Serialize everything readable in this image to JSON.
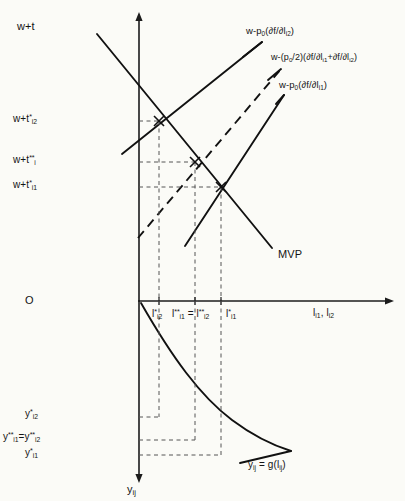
{
  "figure": {
    "type": "economics-diagram",
    "background_color": "#fbfbf7",
    "ink_color": "#111111",
    "upper_panel": {
      "y_axis_label": "w+t",
      "x_axis_label_parts": {
        "base": "l",
        "sub1": "i1",
        "sep": ", ",
        "base2": "l",
        "sub2": "i2"
      },
      "origin_label": "O",
      "y_tick_labels": [
        {
          "id": "w_t_star_i2",
          "base": "w+t",
          "sup": "*",
          "sub": "i2",
          "y_px": 121
        },
        {
          "id": "w_t_dstar_i",
          "base": "w+t",
          "sup": "**",
          "sub": "i",
          "y_px": 162
        },
        {
          "id": "w_t_star_i1",
          "base": "w+t",
          "sup": "*",
          "sub": "i1",
          "y_px": 187
        }
      ],
      "x_tick_labels": [
        {
          "id": "l_star_i2",
          "base": "l",
          "sup": "*",
          "sub": "i2",
          "x_px": 159
        },
        {
          "id": "l_dstar_equal",
          "base": "l",
          "sup": "**",
          "sub": "i1",
          "eq": " = ",
          "base2": "l",
          "sup2": "**",
          "sub2": "i2",
          "x_px": 195
        },
        {
          "id": "l_star_i1",
          "base": "l",
          "sup": "*",
          "sub": "i1",
          "x_px": 221
        }
      ],
      "curve_labels": [
        {
          "id": "mvp",
          "text": "MVP"
        },
        {
          "id": "w_minus_p0_dfdl_i2",
          "prefix": "w-p",
          "sub_p": "0",
          "mid": "(∂f/∂l",
          "sub_l": "i2",
          "suffix": ")"
        },
        {
          "id": "w_minus_half_p0_sum",
          "prefix": "w-(p",
          "sub_p": "0",
          "mid": "/2)(∂f/∂l",
          "sub_l": "i1",
          "mid2": "+∂f/∂l",
          "sub_l2": "i2",
          "suffix": ")"
        },
        {
          "id": "w_minus_p0_dfdl_i1",
          "prefix": "w-p",
          "sub_p": "0",
          "mid": "(∂f/∂l",
          "sub_l": "i1",
          "suffix": ")"
        }
      ],
      "intersections": [
        {
          "id": "eq_i2",
          "x_px": 159,
          "y_px": 121
        },
        {
          "id": "eq_pooled",
          "x_px": 195,
          "y_px": 162
        },
        {
          "id": "eq_i1",
          "x_px": 221,
          "y_px": 187
        }
      ]
    },
    "lower_panel": {
      "y_axis_label_base": "y",
      "y_axis_label_sub": "ij",
      "y_tick_labels": [
        {
          "id": "y_star_i2",
          "base": "y",
          "sup": "*",
          "sub": "i2",
          "y_px": 417
        },
        {
          "id": "y_dstar_equal",
          "base": "y",
          "sup": "**",
          "sub": "i1",
          "eq": "=",
          "base2": "y",
          "sup2": "**",
          "sub2": "i2",
          "y_px": 440
        },
        {
          "id": "y_star_i1",
          "base": "y",
          "sup": "*",
          "sub": "i1",
          "y_px": 455
        }
      ],
      "curve_label": {
        "id": "production_fn",
        "base": "y",
        "sub": "ij",
        "eq": " = g(l",
        "sub2": "ij",
        "suffix": ")"
      }
    }
  }
}
